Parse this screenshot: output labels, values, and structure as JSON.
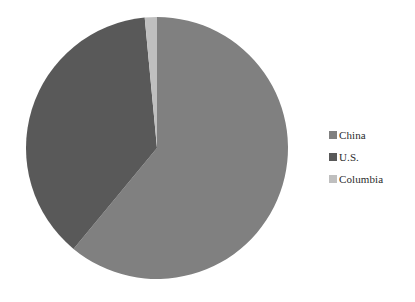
{
  "background_color": "#ffffff",
  "legend": {
    "position": "right",
    "items": [
      {
        "label": "China",
        "color": "#808080"
      },
      {
        "label": "U.S.",
        "color": "#595959"
      },
      {
        "label": "Columbia",
        "color": "#bfbfbf"
      }
    ]
  },
  "chart_data": {
    "type": "pie",
    "title": "",
    "subtitle": "",
    "xlabel": "",
    "ylabel": "",
    "grid": false,
    "legend_position": "right",
    "start_angle_deg": 0,
    "direction": "clockwise",
    "categories": [
      "China",
      "U.S.",
      "Columbia"
    ],
    "values": [
      61.0,
      37.5,
      1.5
    ],
    "value_unit": "percent",
    "colors": [
      "#808080",
      "#595959",
      "#bfbfbf"
    ],
    "slices": [
      {
        "label": "China",
        "value": 61.0,
        "color": "#808080",
        "start_deg": 5.4,
        "end_deg": 225.0
      },
      {
        "label": "U.S.",
        "value": 37.5,
        "color": "#595959",
        "start_deg": 225.0,
        "end_deg": 360.0
      },
      {
        "label": "Columbia",
        "value": 1.5,
        "color": "#bfbfbf",
        "start_deg": 0.0,
        "end_deg": 5.4
      }
    ],
    "data_labels_shown": false
  }
}
